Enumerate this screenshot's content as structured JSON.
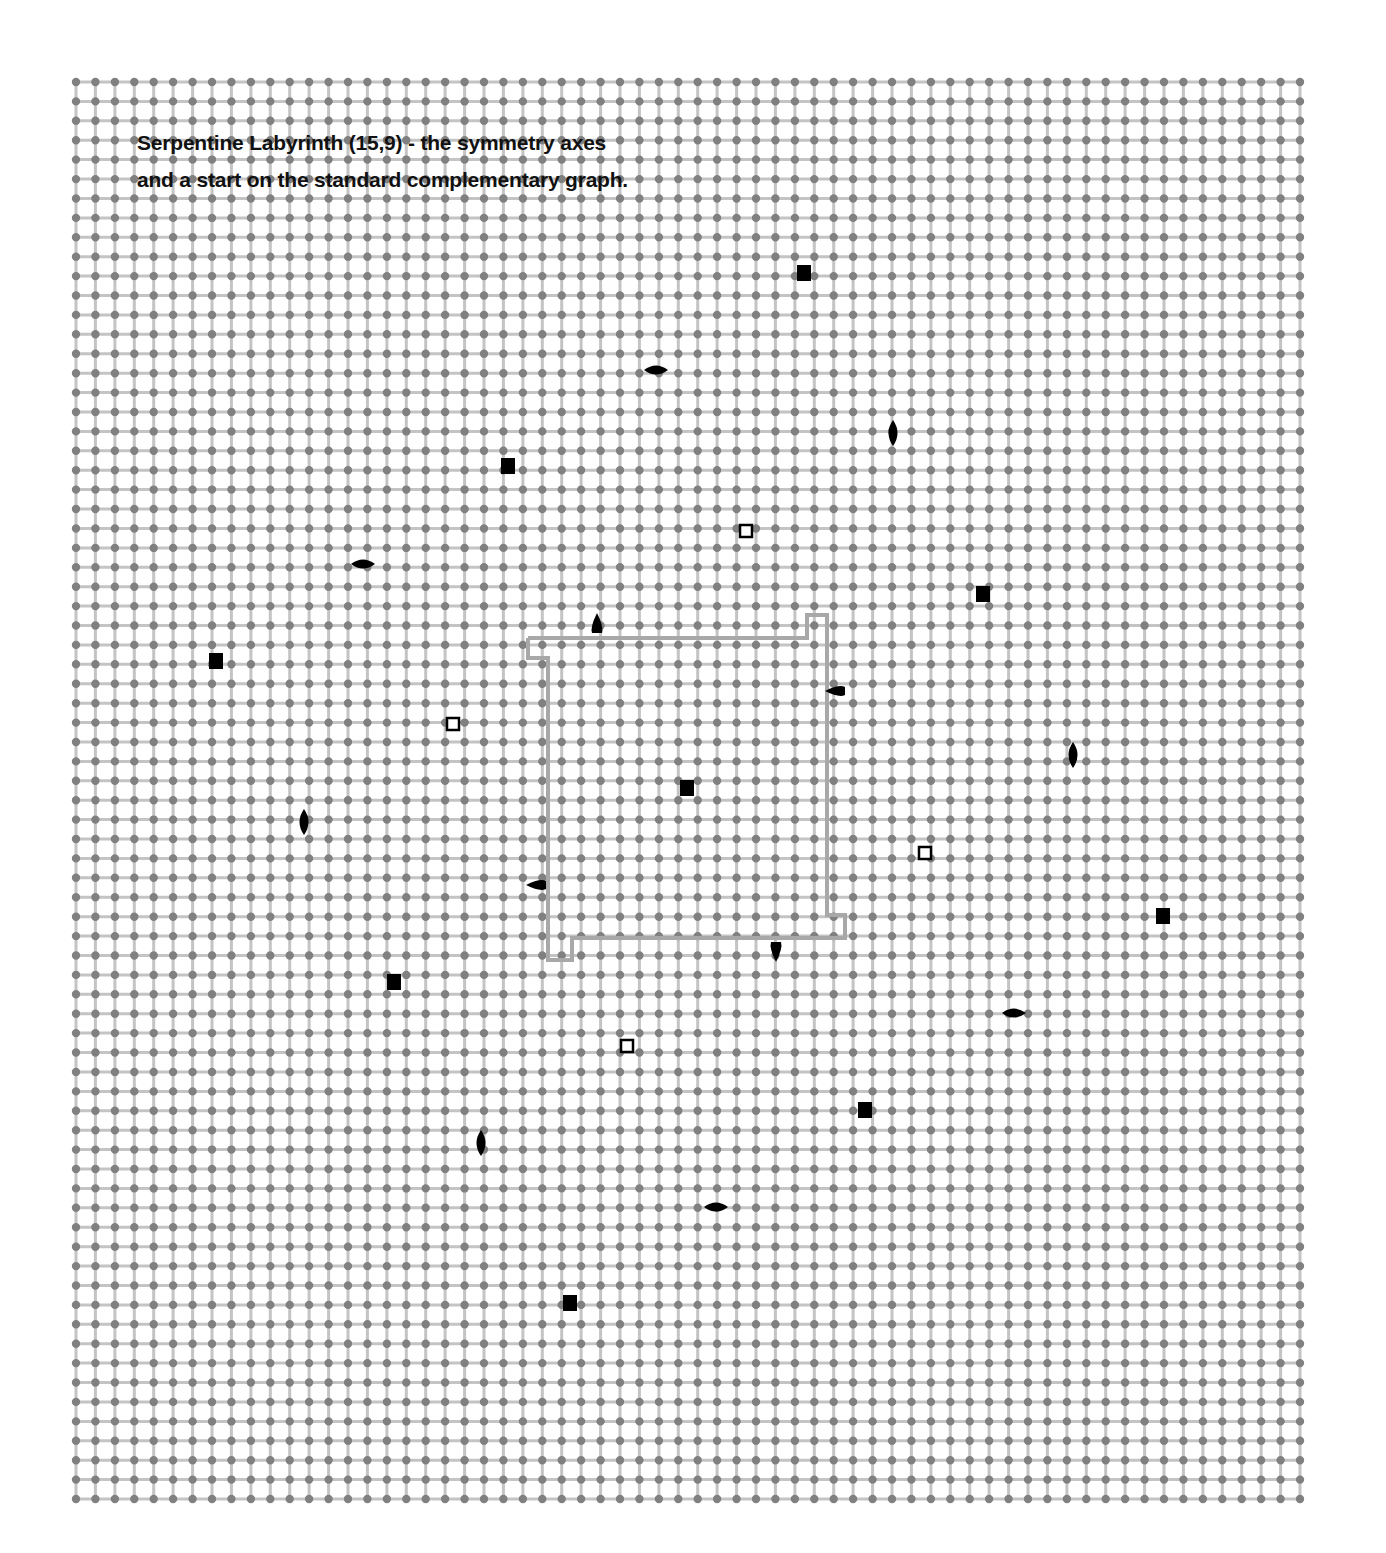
{
  "title": {
    "line1": "Serpentine Labyrinth (15,9) - the symmetry axes",
    "line2": "and a start on the standard complementary graph."
  },
  "grid": {
    "x0": 76,
    "y0": 82,
    "x1": 1300,
    "y1": 1499,
    "cols": 64,
    "rows": 74,
    "dot_color": "#808080",
    "line_color": "#c4c4c4",
    "dot_radius": 4.2
  },
  "outline": {
    "color": "#a8a8a8",
    "width": 4,
    "points": [
      [
        528,
        638
      ],
      [
        807,
        638
      ],
      [
        807,
        615
      ],
      [
        827,
        615
      ],
      [
        827,
        915
      ],
      [
        845,
        915
      ],
      [
        845,
        938
      ],
      [
        572,
        938
      ],
      [
        572,
        960
      ],
      [
        548,
        960
      ],
      [
        548,
        658
      ],
      [
        528,
        658
      ],
      [
        528,
        638
      ]
    ]
  },
  "markers": {
    "filled_squares": [
      [
        804,
        273
      ],
      [
        508,
        466
      ],
      [
        983,
        594
      ],
      [
        216,
        661
      ],
      [
        687,
        788
      ],
      [
        1163,
        916
      ],
      [
        394,
        982
      ],
      [
        865,
        1110
      ],
      [
        570,
        1303
      ]
    ],
    "open_squares": [
      [
        746,
        531
      ],
      [
        453,
        724
      ],
      [
        925,
        853
      ],
      [
        627,
        1046
      ]
    ],
    "h_lenses": [
      [
        656,
        370
      ],
      [
        363,
        564
      ],
      [
        1014,
        1013
      ],
      [
        716,
        1207
      ]
    ],
    "v_lenses": [
      [
        893,
        433
      ],
      [
        304,
        822
      ],
      [
        1073,
        755
      ],
      [
        481,
        1143
      ]
    ],
    "half_lenses": [
      {
        "x": 597,
        "y": 625,
        "dir": "up"
      },
      {
        "x": 837,
        "y": 691,
        "dir": "left"
      },
      {
        "x": 538,
        "y": 885,
        "dir": "left"
      },
      {
        "x": 776,
        "y": 950,
        "dir": "down"
      }
    ]
  }
}
